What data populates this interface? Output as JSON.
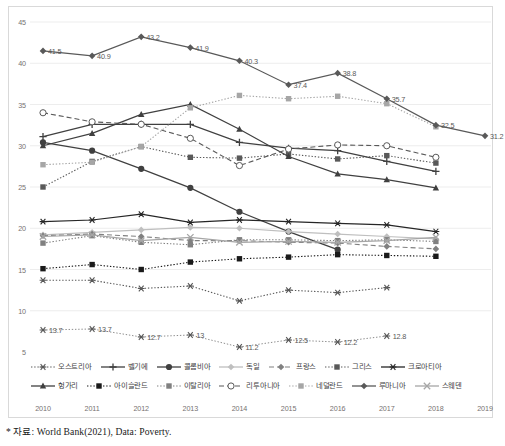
{
  "chart_data": {
    "type": "line",
    "title": "",
    "subtitle": "",
    "xlabel": "",
    "ylabel": "",
    "x": [
      "2010",
      "2011",
      "2012",
      "2013",
      "2014",
      "2015",
      "2016",
      "2017",
      "2018",
      "2019"
    ],
    "ylim": [
      5,
      45
    ],
    "yticks": [
      "5",
      "10",
      "15",
      "20",
      "25",
      "30",
      "35",
      "40",
      "45"
    ],
    "grid": "horizontal",
    "legend_position": "bottom",
    "source_note": "* 자료: World Bank(2021), Data: Poverty.",
    "series": [
      {
        "name": "오스트리아",
        "name_en": "Austria",
        "marker": "asterisk",
        "line": "dotted",
        "color": "#595959",
        "values": [
          13.7,
          13.7,
          12.7,
          13.0,
          11.2,
          12.5,
          12.2,
          12.8,
          null,
          null
        ],
        "labels": [
          "13.7",
          "13.7",
          "12.7",
          "13",
          "11.2",
          "12.5",
          "12.2",
          "12.8",
          "",
          ""
        ],
        "labeled": true
      },
      {
        "name": "벨기에",
        "name_en": "Belgium",
        "marker": "plus",
        "line": "solid",
        "color": "#404040",
        "values": [
          31.1,
          32.6,
          32.6,
          32.6,
          30.4,
          29.7,
          29.4,
          28.1,
          26.9,
          null
        ],
        "labeled": false
      },
      {
        "name": "콜롬비아",
        "name_en": "Colombia",
        "marker": "circle-filled",
        "line": "solid",
        "color": "#404040",
        "values": [
          30.4,
          29.4,
          27.2,
          24.9,
          22.0,
          19.6,
          17.4,
          null,
          null,
          null
        ],
        "labeled": false
      },
      {
        "name": "독일",
        "name_en": "Germany",
        "marker": "diamond",
        "line": "solid",
        "color": "#bfbfbf",
        "values": [
          19.2,
          19.5,
          19.8,
          20.1,
          20.0,
          19.6,
          19.3,
          19.0,
          18.7,
          null
        ],
        "labeled": false
      },
      {
        "name": "프랑스",
        "name_en": "France",
        "marker": "diamond",
        "line": "dashed",
        "color": "#808080",
        "values": [
          19.1,
          19.3,
          19.0,
          18.5,
          18.5,
          18.3,
          18.2,
          17.8,
          17.5,
          null
        ],
        "labeled": false
      },
      {
        "name": "그리스",
        "name_en": "Greece",
        "marker": "square-filled",
        "line": "dotted",
        "color": "#595959",
        "values": [
          25.0,
          28.1,
          29.9,
          28.6,
          28.5,
          29.0,
          28.4,
          28.8,
          27.9,
          null
        ],
        "labeled": false
      },
      {
        "name": "크로아티아",
        "name_en": "Croatia",
        "marker": "asterisk",
        "line": "solid",
        "color": "#262626",
        "values": [
          20.8,
          21.0,
          21.7,
          20.7,
          21.0,
          20.8,
          20.6,
          20.4,
          19.6,
          null
        ],
        "labeled": false
      },
      {
        "name": "헝가리",
        "name_en": "Hungary",
        "marker": "triangle",
        "line": "solid",
        "color": "#404040",
        "values": [
          30.0,
          31.5,
          33.8,
          35.0,
          32.0,
          28.7,
          26.6,
          25.9,
          24.9,
          null
        ],
        "labeled": false
      },
      {
        "name": "아이슬란드",
        "name_en": "Iceland",
        "marker": "square-filled",
        "line": "dotted",
        "color": "#1a1a1a",
        "values": [
          15.1,
          15.6,
          15.0,
          15.9,
          16.3,
          16.5,
          16.8,
          16.7,
          16.6,
          null
        ],
        "labeled": false
      },
      {
        "name": "이탈리아",
        "name_en": "Italy",
        "marker": "square-filled",
        "line": "dotted",
        "color": "#808080",
        "values": [
          18.2,
          19.1,
          18.3,
          18.0,
          18.6,
          18.6,
          18.5,
          18.6,
          18.4,
          null
        ],
        "labeled": false
      },
      {
        "name": "리투아니아",
        "name_en": "Lithuania",
        "marker": "circle-open",
        "line": "dashed",
        "color": "#595959",
        "values": [
          34.0,
          32.9,
          32.6,
          30.9,
          27.6,
          29.6,
          30.1,
          30.0,
          28.6,
          null
        ],
        "labeled": false
      },
      {
        "name": "네덜란드",
        "name_en": "Netherlands",
        "marker": "square-filled",
        "line": "dotted",
        "color": "#a6a6a6",
        "values": [
          27.7,
          28.0,
          29.9,
          34.6,
          36.1,
          35.7,
          36.0,
          35.1,
          32.3,
          null
        ],
        "labeled": false
      },
      {
        "name": "루마니아",
        "name_en": "Romania",
        "marker": "diamond",
        "line": "solid",
        "color": "#595959",
        "values": [
          41.5,
          40.9,
          43.2,
          41.9,
          40.3,
          37.4,
          38.8,
          35.7,
          32.5,
          31.2
        ],
        "labels": [
          "41.5",
          "40.9",
          "43.2",
          "41.9",
          "40.3",
          "37.4",
          "38.8",
          "35.7",
          "32.5",
          "31.2"
        ],
        "labeled": true
      },
      {
        "name": "스웨덴",
        "name_en": "Sweden",
        "marker": "x-cross",
        "line": "solid",
        "color": "#a6a6a6",
        "values": [
          19.0,
          19.2,
          18.5,
          18.9,
          18.3,
          18.4,
          18.3,
          18.5,
          18.9,
          null
        ],
        "labeled": false
      }
    ]
  },
  "axis": {
    "yticks": [
      "45",
      "40",
      "35",
      "30",
      "25",
      "20",
      "15",
      "10",
      "5"
    ],
    "xticks": [
      "2010",
      "2011",
      "2012",
      "2013",
      "2014",
      "2015",
      "2016",
      "2017",
      "2018",
      "2019"
    ]
  },
  "legend": {
    "row1": [
      "오스트리아",
      "벨기에",
      "콜롬비아",
      "독일",
      "프랑스",
      "그리스",
      "크로아티아"
    ],
    "row2": [
      "헝가리",
      "아이슬란드",
      "이탈리아",
      "리투아니아",
      "네덜란드",
      "루마니아",
      "스웨덴"
    ]
  },
  "labels": {
    "romania": [
      "41.5",
      "40.9",
      "43.2",
      "41.9",
      "40.3",
      "37.4",
      "38.8",
      "35.7",
      "32.5",
      "31.2"
    ],
    "austria": [
      "13.7",
      "13.7",
      "12.7",
      "13",
      "11.2",
      "12.5",
      "12.2",
      "12.8"
    ]
  },
  "footer": {
    "note": "* 자료: World Bank(2021), Data: Poverty."
  }
}
